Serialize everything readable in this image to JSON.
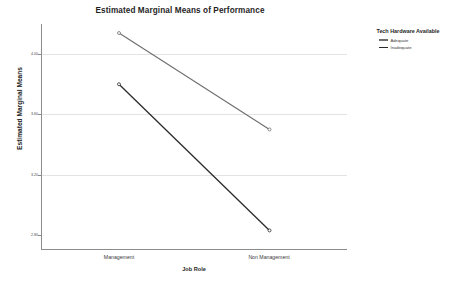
{
  "chart_data": {
    "type": "line",
    "title": "Estimated Marginal Means of Performance",
    "xlabel": "Job Role",
    "ylabel": "Estimated Marginal Means",
    "categories": [
      "Management",
      "Non Management"
    ],
    "ylim": [
      2.7,
      4.2
    ],
    "yticks": [
      4.0,
      3.6,
      3.2,
      2.8
    ],
    "ytick_labels": [
      "4.00",
      "3.60",
      "3.20",
      "2.80"
    ],
    "grid": true,
    "legend_position": "right",
    "legend_title": "Tech Hardware Available",
    "series": [
      {
        "name": "Adequate",
        "color": "#6e6e6e",
        "values": [
          4.14,
          3.5
        ],
        "markers": [
          {
            "category": "Management",
            "value": 4.14
          },
          {
            "category": "Non Management",
            "value": 3.5
          }
        ]
      },
      {
        "name": "Inadequate",
        "color": "#2a2a2a",
        "values": [
          3.8,
          2.83
        ],
        "markers": [
          {
            "category": "Management",
            "value": 3.8
          },
          {
            "category": "Non Management",
            "value": 2.83
          }
        ]
      }
    ]
  },
  "legend": {
    "title": "Tech Hardware Available",
    "items": [
      {
        "label": "Adequate",
        "color": "#6e6e6e"
      },
      {
        "label": "Inadequate",
        "color": "#2a2a2a"
      }
    ]
  },
  "axes": {
    "x_title": "Job Role",
    "y_title": "Estimated Marginal Means",
    "x_tick_labels": [
      "Management",
      "Non Management"
    ],
    "y_tick_labels": [
      "4.00",
      "3.60",
      "3.20",
      "2.80"
    ]
  },
  "colors": {
    "grid": "#e3e3e6",
    "axis": "#8c8c8c",
    "background": "#ffffff",
    "text": "#2b2b2b"
  }
}
